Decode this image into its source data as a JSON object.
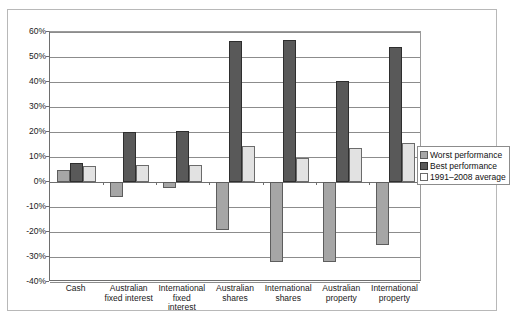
{
  "chart_data": {
    "type": "bar",
    "title": "",
    "subtitle": "",
    "xlabel": "",
    "ylabel": "",
    "ylim": [
      -40,
      60
    ],
    "ytick_step": 10,
    "ytick_labels": [
      "60%",
      "50%",
      "40%",
      "30%",
      "20%",
      "10%",
      "0%",
      "-10%",
      "-20%",
      "-30%",
      "-40%"
    ],
    "ytick_values": [
      60,
      50,
      40,
      30,
      20,
      10,
      0,
      -10,
      -20,
      -30,
      -40
    ],
    "grid": true,
    "legend_position": "right-middle",
    "categories": [
      "Cash",
      "Australian\nfixed interest",
      "International\nfixed\ninterest",
      "Australian\nshares",
      "International\nshares",
      "Australian\nproperty",
      "International\nproperty"
    ],
    "series": [
      {
        "name": "Worst performance",
        "color": "#a6a6a6",
        "values": [
          5.0,
          -6.0,
          -2.5,
          -19.0,
          -32.0,
          -32.0,
          -25.0
        ]
      },
      {
        "name": "Best performance",
        "color": "#595959",
        "values": [
          7.5,
          20.0,
          20.5,
          56.5,
          57.0,
          40.5,
          54.0
        ]
      },
      {
        "name": "1991–2008 average",
        "color": "#e2e2e2",
        "values": [
          6.5,
          7.0,
          7.0,
          14.5,
          9.5,
          13.5,
          15.5
        ]
      }
    ]
  },
  "legend": {
    "items": [
      {
        "label": "Worst performance"
      },
      {
        "label": "Best performance"
      },
      {
        "label": "1991–2008 average"
      }
    ]
  }
}
